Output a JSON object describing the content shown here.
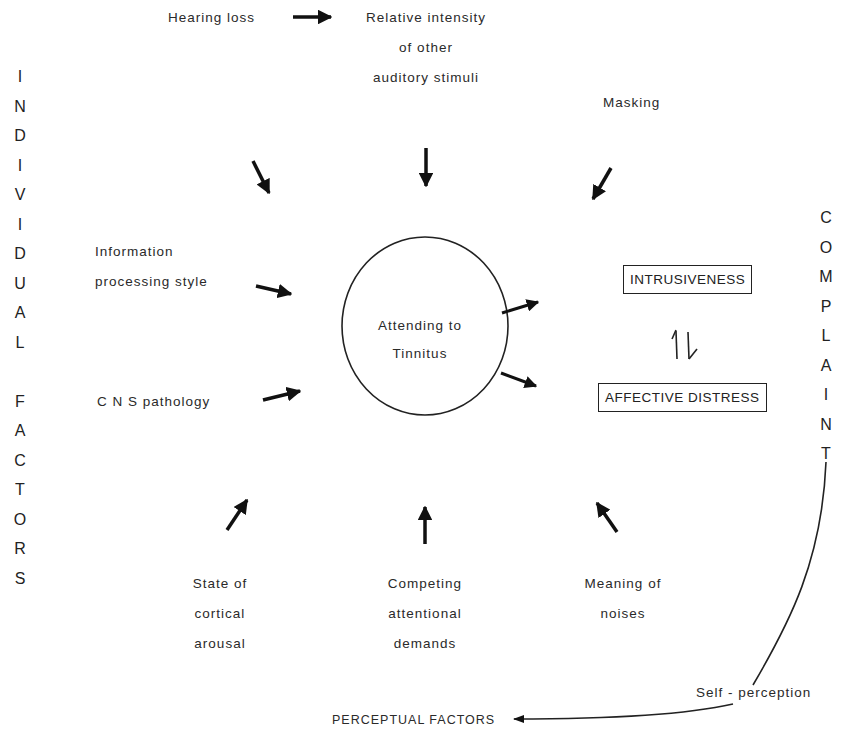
{
  "left_axis": {
    "letters": [
      "I",
      "N",
      "D",
      "I",
      "V",
      "I",
      "D",
      "U",
      "A",
      "L",
      "",
      "F",
      "A",
      "C",
      "T",
      "O",
      "R",
      "S"
    ],
    "title": "INDIVIDUAL FACTORS"
  },
  "right_axis": {
    "letters": [
      "C",
      "O",
      "M",
      "P",
      "L",
      "A",
      "I",
      "N",
      "T"
    ],
    "title": "COMPLAINT"
  },
  "nodes": {
    "hearing_loss": "Hearing loss",
    "relative_intensity": [
      "Relative intensity",
      "of other",
      "auditory stimuli"
    ],
    "masking": "Masking",
    "information_processing": [
      "Information",
      "processing style"
    ],
    "cns_pathology": "C N S pathology",
    "center": [
      "Attending to",
      "Tinnitus"
    ],
    "state_of_arousal": [
      "State of",
      "cortical",
      "arousal"
    ],
    "competing_demands": [
      "Competing",
      "attentional",
      "demands"
    ],
    "meaning_of_noises": [
      "Meaning of",
      "noises"
    ],
    "intrusiveness": "INTRUSIVENESS",
    "affective_distress": "AFFECTIVE DISTRESS",
    "bidirectional_symbol": "⇅",
    "self_perception": "Self - perception",
    "perceptual_factors": "PERCEPTUAL FACTORS"
  },
  "edges": [
    {
      "from": "Hearing loss",
      "to": "Relative intensity of other auditory stimuli"
    },
    {
      "from": "Hearing loss",
      "to": "Attending to Tinnitus"
    },
    {
      "from": "Relative intensity of other auditory stimuli",
      "to": "Attending to Tinnitus"
    },
    {
      "from": "Masking",
      "to": "Attending to Tinnitus"
    },
    {
      "from": "Information processing style",
      "to": "Attending to Tinnitus"
    },
    {
      "from": "C N S pathology",
      "to": "Attending to Tinnitus"
    },
    {
      "from": "State of cortical arousal",
      "to": "Attending to Tinnitus"
    },
    {
      "from": "Competing attentional demands",
      "to": "Attending to Tinnitus"
    },
    {
      "from": "Meaning of noises",
      "to": "Attending to Tinnitus"
    },
    {
      "from": "Attending to Tinnitus",
      "to": "INTRUSIVENESS"
    },
    {
      "from": "Attending to Tinnitus",
      "to": "AFFECTIVE DISTRESS"
    },
    {
      "from": "INTRUSIVENESS",
      "to": "AFFECTIVE DISTRESS",
      "bidirectional": true
    },
    {
      "from": "COMPLAINT",
      "to": "PERCEPTUAL FACTORS",
      "label": "Self - perception"
    }
  ],
  "colors": {
    "ink": "#222222",
    "background": "#ffffff"
  }
}
